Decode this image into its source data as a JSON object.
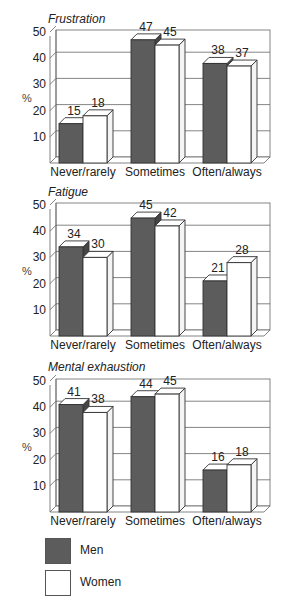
{
  "colors": {
    "men": "#5c5c5c",
    "women": "#ffffff",
    "stroke": "#333333",
    "grid": "#666666"
  },
  "legend": [
    {
      "label": "Men",
      "color": "#5c5c5c"
    },
    {
      "label": "Women",
      "color": "#ffffff"
    }
  ],
  "chart_data": [
    {
      "type": "bar",
      "title": "Frustration",
      "ylabel": "%",
      "xlabel": "",
      "ylim": [
        0,
        50
      ],
      "yticks": [
        10,
        20,
        30,
        40,
        50
      ],
      "categories": [
        "Never/rarely",
        "Sometimes",
        "Often/always"
      ],
      "series": [
        {
          "name": "Men",
          "values": [
            15,
            47,
            38
          ]
        },
        {
          "name": "Women",
          "values": [
            18,
            45,
            37
          ]
        }
      ],
      "grid": true,
      "legend_position": "bottom"
    },
    {
      "type": "bar",
      "title": "Fatigue",
      "ylabel": "%",
      "xlabel": "",
      "ylim": [
        0,
        50
      ],
      "yticks": [
        10,
        20,
        30,
        40,
        50
      ],
      "categories": [
        "Never/rarely",
        "Sometimes",
        "Often/always"
      ],
      "series": [
        {
          "name": "Men",
          "values": [
            34,
            45,
            21
          ]
        },
        {
          "name": "Women",
          "values": [
            30,
            42,
            28
          ]
        }
      ],
      "grid": true,
      "legend_position": "bottom"
    },
    {
      "type": "bar",
      "title": "Mental exhaustion",
      "ylabel": "%",
      "xlabel": "",
      "ylim": [
        0,
        50
      ],
      "yticks": [
        10,
        20,
        30,
        40,
        50
      ],
      "categories": [
        "Never/rarely",
        "Sometimes",
        "Often/always"
      ],
      "series": [
        {
          "name": "Men",
          "values": [
            41,
            44,
            16
          ]
        },
        {
          "name": "Women",
          "values": [
            38,
            45,
            18
          ]
        }
      ],
      "grid": true,
      "legend_position": "bottom"
    }
  ]
}
